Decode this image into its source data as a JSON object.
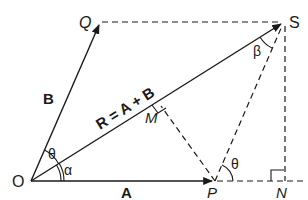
{
  "diagram": {
    "points": {
      "O": {
        "label": "O",
        "x": 31,
        "y": 181
      },
      "P": {
        "label": "P",
        "x": 215,
        "y": 181
      },
      "Q": {
        "label": "Q",
        "x": 100,
        "y": 22
      },
      "S": {
        "label": "S",
        "x": 284,
        "y": 22
      },
      "N": {
        "label": "N",
        "x": 284,
        "y": 181
      },
      "M": {
        "label": "M",
        "x": 160,
        "y": 105
      }
    },
    "vectors": {
      "A": {
        "label": "A",
        "from": "O",
        "to": "P"
      },
      "B": {
        "label": "B",
        "from": "O",
        "to": "Q"
      },
      "R": {
        "label": "R = A + B",
        "from": "O",
        "to": "S"
      }
    },
    "angles": {
      "theta_at_O": "θ",
      "alpha_at_O": "α",
      "beta_at_S": "β",
      "theta_at_P": "θ"
    },
    "labels": {
      "O": "O",
      "P": "P",
      "Q": "Q",
      "S": "S",
      "N": "N",
      "M": "M",
      "A": "A",
      "B": "B",
      "R_eq": "R = A + B",
      "theta_O": "θ",
      "alpha": "α",
      "beta": "β",
      "theta_P": "θ"
    },
    "colors": {
      "line": "#1a1a1a",
      "background": "#ffffff"
    }
  }
}
